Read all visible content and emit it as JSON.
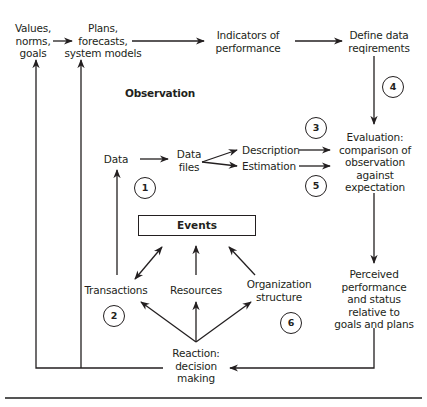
{
  "diagram": {
    "type": "flowchart",
    "section_label": "Observation",
    "nodes": {
      "values": "Values,\nnorms,\ngoals",
      "plans": "Plans,\nforecasts,\nsystem models",
      "indicators": "Indicators of\nperformance",
      "define_data": "Define data\nreqirements",
      "data": "Data",
      "data_files": "Data\nfiles",
      "description": "Description",
      "estimation": "Estimation",
      "evaluation": "Evaluation:\ncomparison of\nobservation\nagainst\nexpectation",
      "events": "Events",
      "transactions": "Transactions",
      "resources": "Resources",
      "org_structure": "Organization\nstructure",
      "perceived": "Perceived\nperformance\nand status\nrelative to\ngoals and plans",
      "reaction": "Reaction:\ndecision\nmaking"
    },
    "step_markers": [
      "1",
      "2",
      "3",
      "4",
      "5",
      "6"
    ],
    "edges": [
      [
        "values",
        "plans"
      ],
      [
        "plans",
        "indicators"
      ],
      [
        "indicators",
        "define_data"
      ],
      [
        "define_data",
        "evaluation"
      ],
      [
        "data",
        "data_files"
      ],
      [
        "data_files",
        "description"
      ],
      [
        "data_files",
        "estimation"
      ],
      [
        "description",
        "evaluation"
      ],
      [
        "estimation",
        "evaluation"
      ],
      [
        "evaluation",
        "perceived"
      ],
      [
        "perceived",
        "reaction"
      ],
      [
        "reaction",
        "values"
      ],
      [
        "reaction",
        "plans"
      ],
      [
        "reaction",
        "transactions"
      ],
      [
        "reaction",
        "resources"
      ],
      [
        "reaction",
        "org_structure"
      ],
      [
        "transactions",
        "events",
        "bidirectional"
      ],
      [
        "resources",
        "events"
      ],
      [
        "org_structure",
        "events"
      ],
      [
        "transactions",
        "data"
      ]
    ]
  }
}
